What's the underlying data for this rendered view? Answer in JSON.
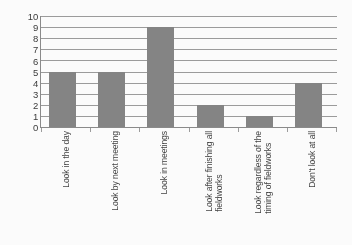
{
  "chart_data": {
    "type": "bar",
    "title": "",
    "subtitle": "",
    "xlabel": "",
    "ylabel": "",
    "ylim": [
      0,
      10
    ],
    "ytick_step": 1,
    "yticks": [
      10,
      9,
      8,
      7,
      6,
      5,
      4,
      3,
      2,
      1,
      0
    ],
    "grid": "horizontal",
    "legend": "none",
    "categories": [
      "Look in the day",
      "Look by next meeting",
      "Look in meetings",
      "Look after finishing all fieldworks",
      "Look regardless of the timing of fieldworks",
      "Don't look at all"
    ],
    "category_lines": [
      [
        "Look in the day"
      ],
      [
        "Look by next meeting"
      ],
      [
        "Look in meetings"
      ],
      [
        "Look after finishing all",
        "fieldworks"
      ],
      [
        "Look regardless of the",
        "timing of fieldworks"
      ],
      [
        "Don't look at all"
      ]
    ],
    "values": [
      5,
      5,
      9,
      2,
      1,
      4
    ],
    "series": [
      {
        "name": "",
        "values": [
          5,
          5,
          9,
          2,
          1,
          4
        ]
      }
    ],
    "colors": {
      "bar_fill": "#828282",
      "gridline": "#9a9a9a",
      "axis_line": "#888888",
      "tick_label": "#343434",
      "category_label": "#3c3c3c",
      "background": "#ffffff"
    }
  }
}
